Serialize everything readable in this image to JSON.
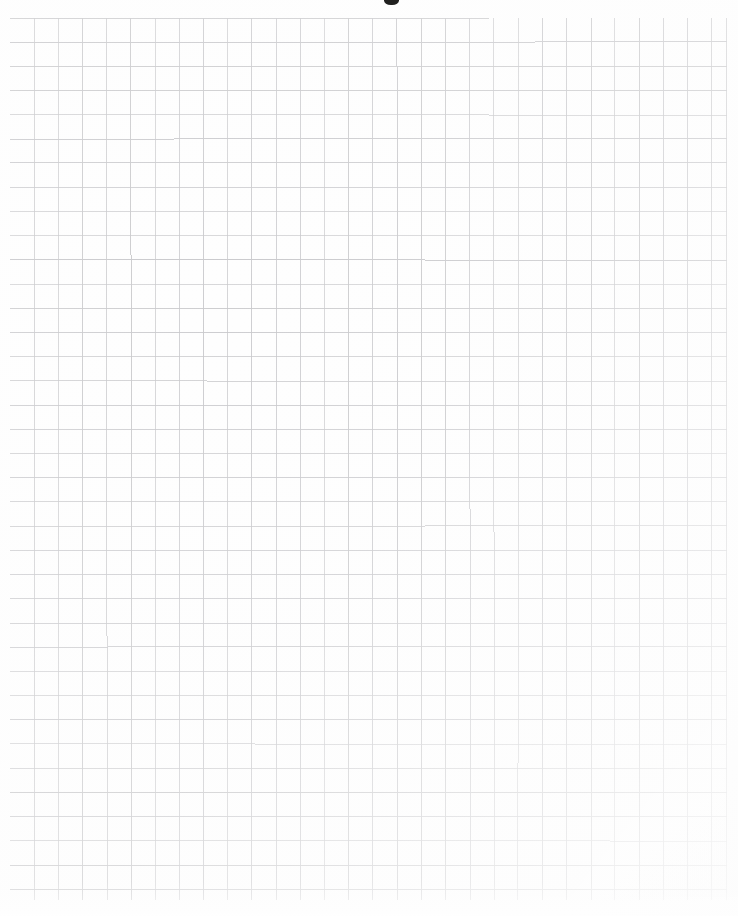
{
  "document": {
    "kind": "graph-paper-scan",
    "title": "Blank quadrille graph paper",
    "description": "A scanned sheet of blank square-ruled graph paper with no written content.",
    "width_px": 738,
    "height_px": 916,
    "background_color": "#ffffff",
    "paper_color": "#fefefe"
  },
  "grid": {
    "line_color": "#c9c9cc",
    "line_width_px": 1,
    "cell_size_px": 24.2,
    "columns": 30,
    "rows": 37,
    "origin_x_px": 10,
    "origin_y_px": 18,
    "extent_right_px": 727,
    "extent_bottom_px": 900,
    "style": "uniform square ruling, no emphasized major lines"
  },
  "artifacts": {
    "top_smudge": {
      "name": "ink-smudge",
      "x_px": 390,
      "y_px": 0,
      "note": "small dark mark cropped by the top edge of the scan"
    },
    "corner_fade": "grid lines fade toward the bottom-right corner",
    "margins": {
      "left_px": 10,
      "top_px": 18,
      "right_px": 11,
      "bottom_px": 16
    }
  },
  "content": {
    "has_writing": false,
    "has_text": false,
    "has_drawings": false,
    "note": "The sheet is entirely blank; only the printed grid is present."
  }
}
